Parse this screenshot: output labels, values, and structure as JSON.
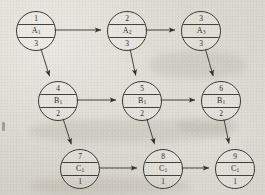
{
  "figure": {
    "type": "activity-on-node-network",
    "background_color": "#d8d5cd",
    "ink_color": "#2f2b27",
    "node_radius_px": 19,
    "node_cell_labels": [
      "number",
      "task",
      "duration"
    ]
  },
  "nodes": [
    {
      "id": "n1",
      "number": "1",
      "task": "A",
      "subscript": "1",
      "duration": "3",
      "row": "A",
      "col": 1,
      "cx": 35,
      "cy": 30
    },
    {
      "id": "n2",
      "number": "2",
      "task": "A",
      "subscript": "2",
      "duration": "3",
      "row": "A",
      "col": 2,
      "cx": 126,
      "cy": 30
    },
    {
      "id": "n3",
      "number": "3",
      "task": "A",
      "subscript": "3",
      "duration": "3",
      "row": "A",
      "col": 3,
      "cx": 200,
      "cy": 30
    },
    {
      "id": "n4",
      "number": "4",
      "task": "B",
      "subscript": "1",
      "duration": "2",
      "row": "B",
      "col": 1,
      "cx": 57,
      "cy": 100
    },
    {
      "id": "n5",
      "number": "5",
      "task": "B",
      "subscript": "1",
      "duration": "2",
      "row": "B",
      "col": 2,
      "cx": 141,
      "cy": 100
    },
    {
      "id": "n6",
      "number": "6",
      "task": "B",
      "subscript": "1",
      "duration": "2",
      "row": "B",
      "col": 3,
      "cx": 220,
      "cy": 100
    },
    {
      "id": "n7",
      "number": "7",
      "task": "C",
      "subscript": "1",
      "duration": "1",
      "row": "C",
      "col": 1,
      "cx": 79,
      "cy": 168
    },
    {
      "id": "n8",
      "number": "8",
      "task": "C",
      "subscript": "1",
      "duration": "1",
      "row": "C",
      "col": 2,
      "cx": 162,
      "cy": 168
    },
    {
      "id": "n9",
      "number": "9",
      "task": "C",
      "subscript": "1",
      "duration": "1",
      "row": "C",
      "col": 3,
      "cx": 234,
      "cy": 168
    }
  ],
  "edges": [
    {
      "id": "e1",
      "from": "n1",
      "to": "n2",
      "kind": "horizontal"
    },
    {
      "id": "e2",
      "from": "n2",
      "to": "n3",
      "kind": "horizontal"
    },
    {
      "id": "e3",
      "from": "n4",
      "to": "n5",
      "kind": "horizontal"
    },
    {
      "id": "e4",
      "from": "n5",
      "to": "n6",
      "kind": "horizontal"
    },
    {
      "id": "e5",
      "from": "n7",
      "to": "n8",
      "kind": "horizontal"
    },
    {
      "id": "e6",
      "from": "n8",
      "to": "n9",
      "kind": "horizontal"
    },
    {
      "id": "e7",
      "from": "n1",
      "to": "n4",
      "kind": "diagonal"
    },
    {
      "id": "e8",
      "from": "n2",
      "to": "n5",
      "kind": "diagonal"
    },
    {
      "id": "e9",
      "from": "n3",
      "to": "n6",
      "kind": "diagonal"
    },
    {
      "id": "e10",
      "from": "n4",
      "to": "n7",
      "kind": "diagonal"
    },
    {
      "id": "e11",
      "from": "n5",
      "to": "n8",
      "kind": "diagonal"
    },
    {
      "id": "e12",
      "from": "n6",
      "to": "n9",
      "kind": "diagonal"
    }
  ]
}
